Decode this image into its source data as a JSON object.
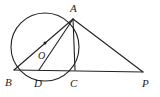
{
  "figure": {
    "kind": "circle-geometry-diagram",
    "background_color": "#ffffff",
    "stroke_color": "#241f20",
    "label_color": "#1c1a1b",
    "canvas": {
      "width": 160,
      "height": 97
    }
  },
  "circle": {
    "name": "circle-O",
    "center_x": 45,
    "center_y": 47,
    "radius": 34,
    "stroke_width": 1.1
  },
  "points": [
    {
      "id": "A",
      "label": "A",
      "x": 73,
      "y": 19,
      "label_x": 70,
      "label_y": 12
    },
    {
      "id": "B",
      "label": "B",
      "x": 14,
      "y": 70,
      "label_x": 5,
      "label_y": 86
    },
    {
      "id": "O",
      "label": "O",
      "x": 45,
      "y": 47,
      "label_x": 38,
      "label_y": 59
    },
    {
      "id": "D",
      "label": "D",
      "x": 39,
      "y": 70,
      "label_x": 34,
      "label_y": 87
    },
    {
      "id": "C",
      "label": "C",
      "x": 75,
      "y": 70,
      "label_x": 72,
      "label_y": 87
    },
    {
      "id": "P",
      "label": "P",
      "x": 143,
      "y": 72,
      "label_x": 143,
      "label_y": 87
    }
  ],
  "center_marker": {
    "name": "center-dot",
    "x": 45,
    "y": 43,
    "radius": 1.5
  },
  "segments": [
    {
      "name": "segment-AB",
      "from": "A",
      "to": "B",
      "stroke_width": 1.1
    },
    {
      "name": "segment-AD",
      "from": "A",
      "to": "D",
      "stroke_width": 1.1
    },
    {
      "name": "segment-AC",
      "from": "A",
      "to": "C",
      "stroke_width": 1.1
    },
    {
      "name": "segment-AP",
      "from": "A",
      "to": "P",
      "stroke_width": 1.1
    },
    {
      "name": "segment-BP",
      "from": "B",
      "to": "P",
      "stroke_width": 1.0
    }
  ],
  "labels": {
    "A": "A",
    "B": "B",
    "O": "O",
    "D": "D",
    "C": "C",
    "P": "P"
  }
}
